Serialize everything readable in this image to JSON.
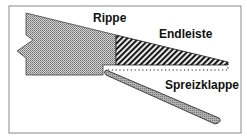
{
  "diagram": {
    "labels": {
      "rib": "Rippe",
      "trailing_edge": "Endleiste",
      "split_flap": "Spreizklappe"
    },
    "colors": {
      "frame": "#8a8a8a",
      "outline": "#222222",
      "rib_fill": "#b8b8b8",
      "hatch": "#1a1a1a",
      "flap_fill": "#9a9a9a",
      "background": "#ffffff"
    }
  }
}
